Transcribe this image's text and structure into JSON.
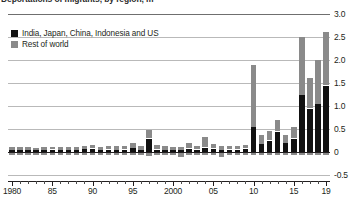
{
  "title": {
    "text": "Deportations of migrants, by region, m"
  },
  "legend": {
    "position": "top-left",
    "items": [
      {
        "label": "India, Japan, China, Indonesia and US",
        "color": "#111111",
        "key": "domestic"
      },
      {
        "label": "Rest of world",
        "color": "#8a8a8a",
        "key": "rest"
      }
    ]
  },
  "axes": {
    "y": {
      "ticks": [
        "3.0",
        "2.5",
        "2.0",
        "1.5",
        "1.0",
        "0.5",
        "0",
        "-0.5"
      ],
      "values": [
        3.0,
        2.5,
        2.0,
        1.5,
        1.0,
        0.5,
        0,
        -0.5
      ],
      "min": -0.5,
      "max": 3.0,
      "grid": true
    },
    "x": {
      "labels": [
        "1980",
        "85",
        "90",
        "95",
        "2000",
        "05",
        "10",
        "15",
        "19"
      ],
      "label_years": [
        1980,
        1985,
        1990,
        1995,
        2000,
        2005,
        2010,
        2015,
        2019
      ],
      "min": 1980,
      "max": 2019
    }
  },
  "chart_data": {
    "type": "bar",
    "stacked": true,
    "title": "Deportations of migrants, by region, m",
    "xlabel": "",
    "ylabel": "",
    "ylim": [
      -0.5,
      3.0
    ],
    "grid": true,
    "legend_position": "top-left",
    "categories": [
      1980,
      1981,
      1982,
      1983,
      1984,
      1985,
      1986,
      1987,
      1988,
      1989,
      1990,
      1991,
      1992,
      1993,
      1994,
      1995,
      1996,
      1997,
      1998,
      1999,
      2000,
      2001,
      2002,
      2003,
      2004,
      2005,
      2006,
      2007,
      2008,
      2009,
      2010,
      2011,
      2012,
      2013,
      2014,
      2015,
      2016,
      2017,
      2018,
      2019
    ],
    "series": [
      {
        "name": "India, Japan, China, Indonesia and US",
        "color": "#111111",
        "values": [
          0.05,
          0.05,
          0.05,
          0.04,
          0.05,
          0.06,
          0.04,
          0.05,
          0.05,
          0.07,
          0.08,
          0.05,
          0.06,
          0.05,
          0.06,
          0.09,
          0.05,
          0.3,
          0.06,
          0.05,
          0.05,
          0.04,
          0.08,
          0.06,
          0.1,
          0.08,
          0.05,
          0.06,
          0.06,
          0.08,
          0.55,
          0.18,
          0.25,
          0.45,
          0.2,
          0.3,
          1.25,
          0.95,
          1.05,
          1.45
        ]
      },
      {
        "name": "Rest of world",
        "color": "#8a8a8a",
        "values": [
          0.06,
          0.06,
          0.05,
          0.05,
          0.06,
          0.05,
          0.06,
          0.05,
          0.05,
          0.06,
          0.08,
          0.06,
          0.06,
          0.07,
          0.06,
          0.1,
          0.08,
          0.18,
          0.1,
          0.07,
          0.06,
          0.06,
          0.12,
          0.08,
          0.22,
          0.1,
          0.07,
          0.07,
          0.06,
          0.08,
          1.35,
          0.18,
          0.2,
          0.25,
          0.18,
          0.25,
          1.25,
          0.65,
          0.95,
          1.15
        ]
      }
    ],
    "negative_values": [
      -0.06,
      -0.05,
      -0.05,
      -0.06,
      -0.05,
      -0.04,
      -0.06,
      -0.05,
      -0.05,
      -0.04,
      -0.05,
      -0.06,
      -0.06,
      -0.05,
      -0.05,
      -0.04,
      -0.06,
      -0.08,
      -0.06,
      -0.07,
      -0.05,
      -0.1,
      -0.05,
      -0.05,
      -0.05,
      -0.06,
      -0.1,
      -0.06,
      -0.05,
      -0.05,
      -0.05,
      -0.05,
      -0.04,
      -0.04,
      -0.04,
      -0.04,
      -0.04,
      -0.04,
      -0.04,
      -0.04
    ]
  },
  "bars": [
    {
      "year": 1980,
      "pos": [
        {
          "c": "dom",
          "v": 0.05
        },
        {
          "c": "row",
          "v": 0.06
        }
      ],
      "neg": 0.06
    },
    {
      "year": 1981,
      "pos": [
        {
          "c": "dom",
          "v": 0.05
        },
        {
          "c": "row",
          "v": 0.06
        }
      ],
      "neg": 0.05
    },
    {
      "year": 1982,
      "pos": [
        {
          "c": "dom",
          "v": 0.05
        },
        {
          "c": "row",
          "v": 0.05
        }
      ],
      "neg": 0.05
    },
    {
      "year": 1983,
      "pos": [
        {
          "c": "dom",
          "v": 0.04
        },
        {
          "c": "row",
          "v": 0.05
        }
      ],
      "neg": 0.06
    },
    {
      "year": 1984,
      "pos": [
        {
          "c": "dom",
          "v": 0.05
        },
        {
          "c": "row",
          "v": 0.06
        }
      ],
      "neg": 0.05
    },
    {
      "year": 1985,
      "pos": [
        {
          "c": "dom",
          "v": 0.06
        },
        {
          "c": "row",
          "v": 0.05
        }
      ],
      "neg": 0.04
    },
    {
      "year": 1986,
      "pos": [
        {
          "c": "dom",
          "v": 0.04
        },
        {
          "c": "row",
          "v": 0.06
        }
      ],
      "neg": 0.06
    },
    {
      "year": 1987,
      "pos": [
        {
          "c": "dom",
          "v": 0.05
        },
        {
          "c": "row",
          "v": 0.05
        }
      ],
      "neg": 0.05
    },
    {
      "year": 1988,
      "pos": [
        {
          "c": "dom",
          "v": 0.05
        },
        {
          "c": "row",
          "v": 0.05
        }
      ],
      "neg": 0.05
    },
    {
      "year": 1989,
      "pos": [
        {
          "c": "dom",
          "v": 0.07
        },
        {
          "c": "row",
          "v": 0.06
        }
      ],
      "neg": 0.04
    },
    {
      "year": 1990,
      "pos": [
        {
          "c": "dom",
          "v": 0.08
        },
        {
          "c": "row",
          "v": 0.08
        }
      ],
      "neg": 0.05
    },
    {
      "year": 1991,
      "pos": [
        {
          "c": "dom",
          "v": 0.05
        },
        {
          "c": "row",
          "v": 0.06
        }
      ],
      "neg": 0.06
    },
    {
      "year": 1992,
      "pos": [
        {
          "c": "dom",
          "v": 0.06
        },
        {
          "c": "row",
          "v": 0.06
        }
      ],
      "neg": 0.06
    },
    {
      "year": 1993,
      "pos": [
        {
          "c": "dom",
          "v": 0.05
        },
        {
          "c": "row",
          "v": 0.07
        }
      ],
      "neg": 0.05
    },
    {
      "year": 1994,
      "pos": [
        {
          "c": "dom",
          "v": 0.06
        },
        {
          "c": "row",
          "v": 0.06
        }
      ],
      "neg": 0.05
    },
    {
      "year": 1995,
      "pos": [
        {
          "c": "dom",
          "v": 0.09
        },
        {
          "c": "row",
          "v": 0.1
        }
      ],
      "neg": 0.04
    },
    {
      "year": 1996,
      "pos": [
        {
          "c": "dom",
          "v": 0.05
        },
        {
          "c": "row",
          "v": 0.08
        }
      ],
      "neg": 0.06
    },
    {
      "year": 1997,
      "pos": [
        {
          "c": "dom",
          "v": 0.3
        },
        {
          "c": "row",
          "v": 0.18
        }
      ],
      "neg": 0.08
    },
    {
      "year": 1998,
      "pos": [
        {
          "c": "dom",
          "v": 0.06
        },
        {
          "c": "row",
          "v": 0.1
        }
      ],
      "neg": 0.06
    },
    {
      "year": 1999,
      "pos": [
        {
          "c": "dom",
          "v": 0.05
        },
        {
          "c": "row",
          "v": 0.07
        }
      ],
      "neg": 0.07
    },
    {
      "year": 2000,
      "pos": [
        {
          "c": "dom",
          "v": 0.05
        },
        {
          "c": "row",
          "v": 0.06
        }
      ],
      "neg": 0.05
    },
    {
      "year": 2001,
      "pos": [
        {
          "c": "dom",
          "v": 0.04
        },
        {
          "c": "row",
          "v": 0.06
        }
      ],
      "neg": 0.1
    },
    {
      "year": 2002,
      "pos": [
        {
          "c": "dom",
          "v": 0.08
        },
        {
          "c": "row",
          "v": 0.12
        }
      ],
      "neg": 0.05
    },
    {
      "year": 2003,
      "pos": [
        {
          "c": "dom",
          "v": 0.06
        },
        {
          "c": "row",
          "v": 0.08
        }
      ],
      "neg": 0.05
    },
    {
      "year": 2004,
      "pos": [
        {
          "c": "dom",
          "v": 0.1
        },
        {
          "c": "row",
          "v": 0.22
        }
      ],
      "neg": 0.05
    },
    {
      "year": 2005,
      "pos": [
        {
          "c": "dom",
          "v": 0.08
        },
        {
          "c": "row",
          "v": 0.1
        }
      ],
      "neg": 0.06
    },
    {
      "year": 2006,
      "pos": [
        {
          "c": "dom",
          "v": 0.05
        },
        {
          "c": "row",
          "v": 0.07
        }
      ],
      "neg": 0.1
    },
    {
      "year": 2007,
      "pos": [
        {
          "c": "dom",
          "v": 0.06
        },
        {
          "c": "row",
          "v": 0.07
        }
      ],
      "neg": 0.06
    },
    {
      "year": 2008,
      "pos": [
        {
          "c": "dom",
          "v": 0.06
        },
        {
          "c": "row",
          "v": 0.06
        }
      ],
      "neg": 0.05
    },
    {
      "year": 2009,
      "pos": [
        {
          "c": "dom",
          "v": 0.08
        },
        {
          "c": "row",
          "v": 0.08
        }
      ],
      "neg": 0.05
    },
    {
      "year": 2010,
      "pos": [
        {
          "c": "dom",
          "v": 0.55
        },
        {
          "c": "row",
          "v": 1.35
        }
      ],
      "neg": 0.05
    },
    {
      "year": 2011,
      "pos": [
        {
          "c": "dom",
          "v": 0.18
        },
        {
          "c": "row",
          "v": 0.18
        }
      ],
      "neg": 0.05
    },
    {
      "year": 2012,
      "pos": [
        {
          "c": "dom",
          "v": 0.25
        },
        {
          "c": "row",
          "v": 0.2
        }
      ],
      "neg": 0.04
    },
    {
      "year": 2013,
      "pos": [
        {
          "c": "dom",
          "v": 0.45
        },
        {
          "c": "row",
          "v": 0.25
        }
      ],
      "neg": 0.04
    },
    {
      "year": 2014,
      "pos": [
        {
          "c": "dom",
          "v": 0.2
        },
        {
          "c": "row",
          "v": 0.18
        }
      ],
      "neg": 0.04
    },
    {
      "year": 2015,
      "pos": [
        {
          "c": "dom",
          "v": 0.3
        },
        {
          "c": "row",
          "v": 0.25
        }
      ],
      "neg": 0.04
    },
    {
      "year": 2016,
      "pos": [
        {
          "c": "dom",
          "v": 1.25
        },
        {
          "c": "row",
          "v": 1.25
        }
      ],
      "neg": 0.04
    },
    {
      "year": 2017,
      "pos": [
        {
          "c": "dom",
          "v": 0.95
        },
        {
          "c": "row",
          "v": 0.65
        }
      ],
      "neg": 0.04
    },
    {
      "year": 2018,
      "pos": [
        {
          "c": "dom",
          "v": 1.05
        },
        {
          "c": "row",
          "v": 0.95
        }
      ],
      "neg": 0.04
    },
    {
      "year": 2019,
      "pos": [
        {
          "c": "dom",
          "v": 1.45
        },
        {
          "c": "row",
          "v": 1.15
        }
      ],
      "neg": 0.04
    }
  ]
}
